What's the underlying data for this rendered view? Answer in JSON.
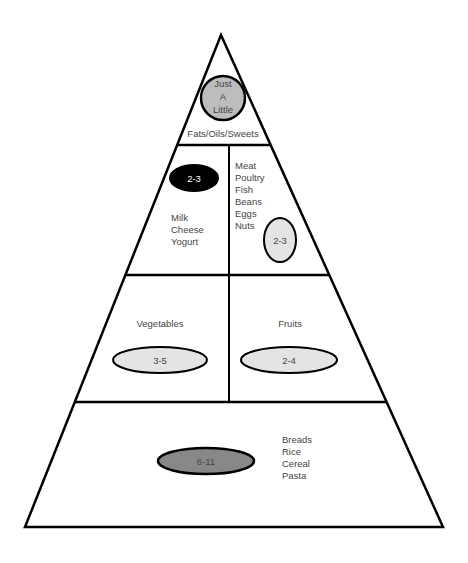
{
  "diagram": {
    "type": "food-pyramid",
    "colors": {
      "outline": "#000000",
      "light_fill": "#e4e4e4",
      "mid_fill": "#bdbdbd",
      "dark_fill": "#888888",
      "black_fill": "#000000",
      "text": "#444444"
    },
    "tiers": {
      "top": {
        "label": "Fats/Oils/Sweets",
        "servings": [
          "Just",
          "A",
          "Little"
        ]
      },
      "dairy": {
        "servings": "2-3",
        "items": [
          "Milk",
          "Cheese",
          "Yogurt"
        ]
      },
      "protein": {
        "servings": "2-3",
        "items": [
          "Meat",
          "Poultry",
          "Fish",
          "Beans",
          "Eggs",
          "Nuts"
        ]
      },
      "vegetables": {
        "label": "Vegetables",
        "servings": "3-5"
      },
      "fruits": {
        "label": "Fruits",
        "servings": "2-4"
      },
      "grains": {
        "servings": "6-11",
        "items": [
          "Breads",
          "Rice",
          "Cereal",
          "Pasta"
        ]
      }
    }
  }
}
